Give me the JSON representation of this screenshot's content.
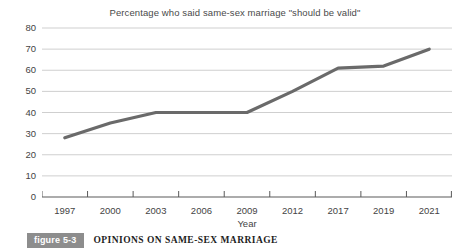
{
  "figure": {
    "badge_label": "figure 5-3",
    "caption": "OPINIONS ON SAME-SEX MARRIAGE"
  },
  "colors": {
    "line": "#6a6a6a",
    "gridline": "#cfcfcf",
    "axis": "#5a5a5a",
    "text": "#444444",
    "badge_bg": "#8d8d8d",
    "badge_text": "#ffffff",
    "background": "#ffffff"
  },
  "chart_data": {
    "type": "line",
    "title": "Percentage who said same-sex marriage \"should be valid\"",
    "xlabel": "Year",
    "ylabel": "",
    "categories": [
      "1997",
      "2000",
      "2003",
      "2006",
      "2009",
      "2012",
      "2017",
      "2019",
      "2021"
    ],
    "values": [
      28,
      35,
      40,
      40,
      40,
      50,
      61,
      62,
      70
    ],
    "ylim": [
      0,
      80
    ],
    "yticks": [
      0,
      10,
      20,
      30,
      40,
      50,
      60,
      70,
      80
    ],
    "ytick_labels": [
      "0",
      "10",
      "20",
      "30",
      "40",
      "50",
      "60",
      "70",
      "80"
    ],
    "grid": true,
    "legend": false,
    "series": [
      {
        "name": "Percentage who said same-sex marriage should be valid",
        "values": [
          28,
          35,
          40,
          40,
          40,
          50,
          61,
          62,
          70
        ]
      }
    ]
  }
}
